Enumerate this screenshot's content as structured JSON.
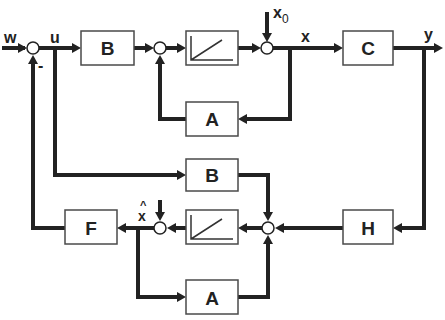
{
  "diagram": {
    "signals": {
      "w": "w",
      "u": "u",
      "x": "x",
      "x0": "x",
      "x0_sub": "0",
      "y": "y",
      "xhat": "x",
      "xhat_accent": "^",
      "minus": "-"
    },
    "blocks": {
      "plant_input_B": "B",
      "plant_integrator": "∫",
      "plant_feedback_A": "A",
      "output_C": "C",
      "observer_input_B": "B",
      "observer_integrator": "∫",
      "observer_feedback_A": "A",
      "observer_gain_H": "H",
      "controller_F": "F"
    },
    "colors": {
      "line": "#222222",
      "block_border": "#4a4a4a",
      "background": "#ffffff"
    }
  }
}
